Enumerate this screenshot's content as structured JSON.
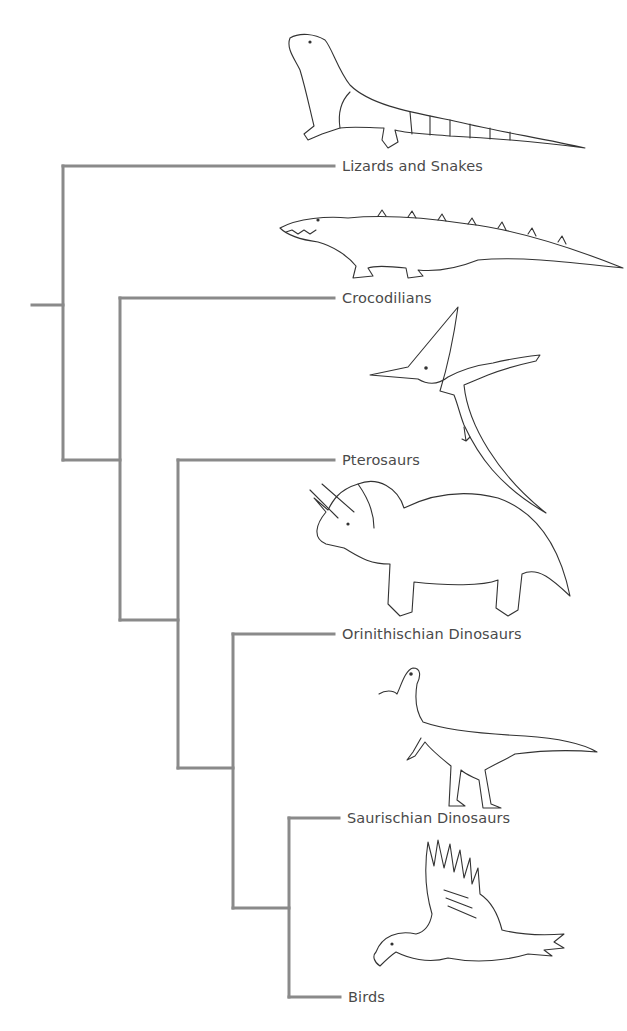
{
  "diagram": {
    "type": "cladogram",
    "line_color": "#8a8a8a",
    "text_color": "#4a4a4a",
    "taxa": [
      {
        "id": "lizards",
        "label": "Lizards and Snakes",
        "illustration": "komodo-lizard"
      },
      {
        "id": "crocodilians",
        "label": "Crocodilians",
        "illustration": "crocodile"
      },
      {
        "id": "pterosaurs",
        "label": "Pterosaurs",
        "illustration": "pterosaur"
      },
      {
        "id": "orinithischian",
        "label": "Orinithischian Dinosaurs",
        "illustration": "triceratops"
      },
      {
        "id": "saurischian",
        "label": "Saurischian Dinosaurs",
        "illustration": "theropod"
      },
      {
        "id": "birds",
        "label": "Birds",
        "illustration": "eagle"
      }
    ],
    "topology": "(Lizards and Snakes, (Crocodilians, (Pterosaurs, (Orinithischian Dinosaurs, (Saurischian Dinosaurs, Birds)))))"
  }
}
